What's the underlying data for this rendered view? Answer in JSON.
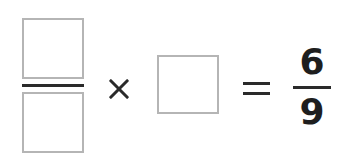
{
  "expression": {
    "left_fraction": {
      "numerator": "",
      "denominator": ""
    },
    "operator": "×",
    "middle_value": "",
    "equals": "=",
    "result_fraction": {
      "numerator": "6",
      "denominator": "9"
    }
  },
  "colors": {
    "box_border": "#b5b5b5",
    "ink": "#2a2a2a"
  }
}
